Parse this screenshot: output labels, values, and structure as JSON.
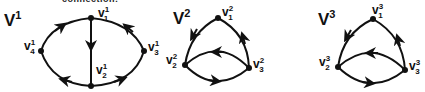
{
  "cut_text": "connection:",
  "graphs": [
    {
      "name": "V",
      "sup": "1",
      "vertices": [
        {
          "id": "v1",
          "base": "v",
          "sup": "1",
          "sub": "1"
        },
        {
          "id": "v2",
          "base": "v",
          "sup": "1",
          "sub": "2"
        },
        {
          "id": "v3",
          "base": "v",
          "sup": "1",
          "sub": "3"
        },
        {
          "id": "v4",
          "base": "v",
          "sup": "1",
          "sub": "4"
        }
      ],
      "edges": [
        {
          "from": "v4",
          "to": "v1"
        },
        {
          "from": "v3",
          "to": "v1"
        },
        {
          "from": "v1",
          "to": "v2"
        },
        {
          "from": "v2",
          "to": "v4"
        },
        {
          "from": "v2",
          "to": "v3"
        }
      ]
    },
    {
      "name": "V",
      "sup": "2",
      "vertices": [
        {
          "id": "v1",
          "base": "v",
          "sup": "2",
          "sub": "1"
        },
        {
          "id": "v2",
          "base": "v",
          "sup": "2",
          "sub": "2"
        },
        {
          "id": "v3",
          "base": "v",
          "sup": "2",
          "sub": "3"
        }
      ],
      "edges": [
        {
          "from": "v1",
          "to": "v2"
        },
        {
          "from": "v3",
          "to": "v1"
        },
        {
          "from": "v3",
          "to": "v2"
        },
        {
          "from": "v2",
          "to": "v3"
        }
      ]
    },
    {
      "name": "V",
      "sup": "3",
      "vertices": [
        {
          "id": "v1",
          "base": "v",
          "sup": "3",
          "sub": "1"
        },
        {
          "id": "v2",
          "base": "v",
          "sup": "3",
          "sub": "2"
        },
        {
          "id": "v3",
          "base": "v",
          "sup": "3",
          "sub": "3"
        }
      ],
      "edges": [
        {
          "from": "v1",
          "to": "v2"
        },
        {
          "from": "v3",
          "to": "v1"
        },
        {
          "from": "v3",
          "to": "v2"
        },
        {
          "from": "v2",
          "to": "v3"
        }
      ]
    }
  ]
}
